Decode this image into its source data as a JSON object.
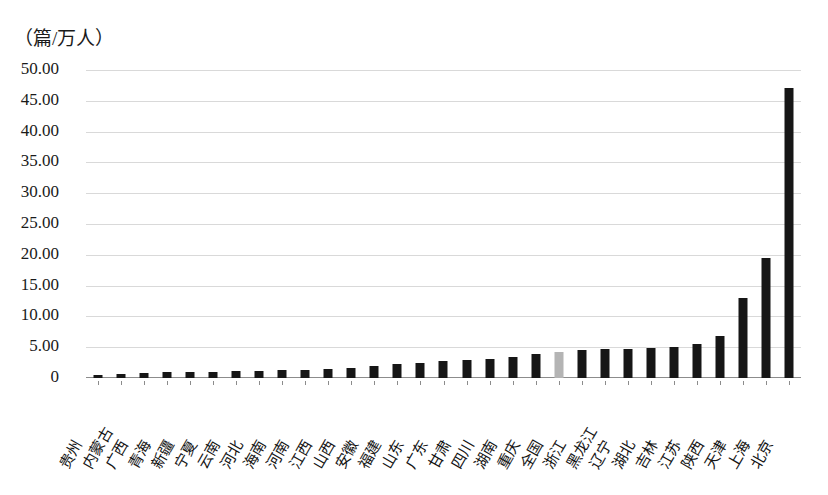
{
  "chart_data": {
    "type": "bar",
    "title": "",
    "subtitle": "",
    "xlabel": "",
    "ylabel": "（篇/万人）",
    "unit_caption": "（篇/万人）",
    "ylim": [
      0,
      50
    ],
    "ytick_labels": [
      "50.00",
      "45.00",
      "40.00",
      "35.00",
      "30.00",
      "25.00",
      "20.00",
      "15.00",
      "10.00",
      "5.00",
      "0"
    ],
    "ytick_values": [
      50,
      45,
      40,
      35,
      30,
      25,
      20,
      15,
      10,
      5,
      0
    ],
    "grid": true,
    "legend": "none",
    "highlight_category": "全国",
    "colors": {
      "bar": "#161616",
      "highlight_bar": "#b4b4b4",
      "gridline": "#d9d9d9",
      "axis": "#8c8c8c",
      "text": "#1a1a1a"
    },
    "categories": [
      "贵州",
      "内蒙古",
      "广西",
      "青海",
      "新疆",
      "宁夏",
      "云南",
      "河北",
      "海南",
      "河南",
      "江西",
      "山西",
      "安徽",
      "福建",
      "山东",
      "广东",
      "甘肃",
      "四川",
      "湖南",
      "重庆",
      "全国",
      "浙江",
      "黑龙江",
      "辽宁",
      "湖北",
      "吉林",
      "江苏",
      "陕西",
      "天津",
      "上海",
      "北京"
    ],
    "values": [
      0.45,
      0.6,
      0.75,
      0.95,
      1.0,
      1.05,
      1.1,
      1.15,
      1.25,
      1.35,
      1.45,
      1.6,
      1.9,
      2.2,
      2.45,
      2.7,
      2.9,
      3.1,
      3.35,
      3.9,
      4.2,
      4.55,
      4.65,
      4.75,
      4.9,
      5.1,
      5.6,
      6.9,
      13.0,
      19.5,
      47.0
    ]
  }
}
